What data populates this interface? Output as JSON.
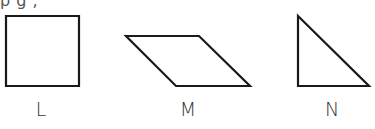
{
  "clipped_header_text": "    p  g        ,",
  "shapes": [
    {
      "id": "L",
      "label": "L",
      "type": "square",
      "points": [
        [
          6,
          16
        ],
        [
          79,
          16
        ],
        [
          79,
          86
        ],
        [
          6,
          86
        ]
      ],
      "label_x": 41
    },
    {
      "id": "M",
      "label": "M",
      "type": "parallelogram",
      "points": [
        [
          126,
          36
        ],
        [
          199,
          36
        ],
        [
          250,
          86
        ],
        [
          176,
          86
        ]
      ],
      "label_x": 188
    },
    {
      "id": "N",
      "label": "N",
      "type": "right-triangle",
      "points": [
        [
          298,
          16
        ],
        [
          369,
          86
        ],
        [
          298,
          86
        ]
      ],
      "label_x": 332
    }
  ],
  "colors": {
    "stroke": "#1a1a1a",
    "label": "#333333"
  }
}
